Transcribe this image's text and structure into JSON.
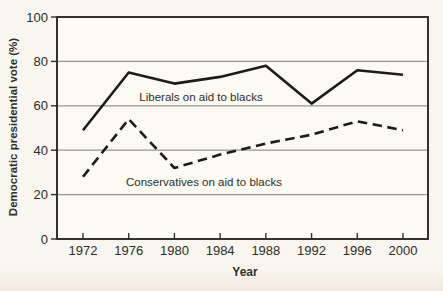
{
  "figure": {
    "background": "#f8f6ee",
    "plot_background": "#fbfaf3",
    "axis_color": "#32312c",
    "gridline_color": "#97968e",
    "text_color": "#2e2d29"
  },
  "chart_data": {
    "type": "line",
    "title": "",
    "xlabel": "Year",
    "ylabel": "Democratic presidential vote (%)",
    "categories": [
      "1972",
      "1976",
      "1980",
      "1984",
      "1988",
      "1992",
      "1996",
      "2000"
    ],
    "yticks": [
      0,
      20,
      40,
      60,
      80,
      100
    ],
    "ylim": [
      0,
      100
    ],
    "grid": "horizontal",
    "legend_position": "inline-annotations",
    "series": [
      {
        "id": "liberals",
        "name": "Liberals on aid to blacks",
        "line_style": "solid",
        "color": "#1d1c1a",
        "values": [
          49,
          75,
          70,
          73,
          78,
          61,
          76,
          74
        ]
      },
      {
        "id": "conservatives",
        "name": "Conservatives on aid to blacks",
        "line_style": "dashed",
        "color": "#1d1c1a",
        "values": [
          28,
          54,
          32,
          38,
          43,
          47,
          53,
          49
        ]
      }
    ]
  }
}
